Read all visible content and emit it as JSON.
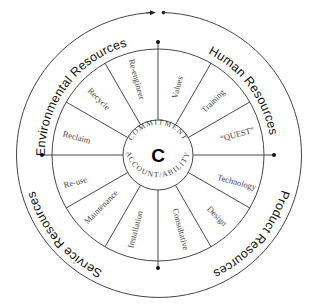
{
  "diagram": {
    "center_letter": "C",
    "hub_ring": {
      "top": "COMMITMENT",
      "bottom": "ACCOUNTABILITY",
      "bottom_display": "ACCOUNT/ABILITY"
    },
    "quadrants": [
      {
        "label": "Environmental Resources",
        "position": "top-left"
      },
      {
        "label": "Human Resources",
        "position": "top-right"
      },
      {
        "label": "Product Resources",
        "position": "bottom-right"
      },
      {
        "label": "Service Resources",
        "position": "bottom-left"
      }
    ],
    "segments": [
      {
        "label": "Values",
        "quadrant": "Human Resources"
      },
      {
        "label": "Training",
        "quadrant": "Human Resources"
      },
      {
        "label": "“QUEST”",
        "quadrant": "Human Resources"
      },
      {
        "label": "Technology",
        "quadrant": "Product Resources"
      },
      {
        "label": "Design",
        "quadrant": "Product Resources"
      },
      {
        "label": "Consultative",
        "quadrant": "Product Resources"
      },
      {
        "label": "Installation",
        "quadrant": "Service Resources"
      },
      {
        "label": "Maintenance",
        "quadrant": "Service Resources"
      },
      {
        "label": "Re-use",
        "quadrant": "Service Resources"
      },
      {
        "label": "Reclaim",
        "quadrant": "Environmental Resources"
      },
      {
        "label": "Recycle",
        "quadrant": "Environmental Resources"
      },
      {
        "label": "Re-engineer",
        "quadrant": "Environmental Resources"
      }
    ],
    "colors": {
      "lines": "#333333",
      "text": "#111111",
      "segment_text": "#444444",
      "background": "#ffffff"
    }
  }
}
